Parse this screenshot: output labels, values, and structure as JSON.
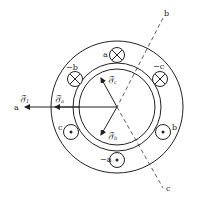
{
  "diagram": {
    "axes": {
      "a": "a",
      "b": "b",
      "c": "c"
    },
    "conductors": [
      {
        "label": "a",
        "type": "cross"
      },
      {
        "label": "−b",
        "type": "cross"
      },
      {
        "label": "−c",
        "type": "cross"
      },
      {
        "label": "c",
        "type": "dot"
      },
      {
        "label": "b",
        "type": "dot"
      },
      {
        "label": "−a",
        "type": "dot"
      }
    ],
    "vectors": {
      "total": "𝔉",
      "total_sub": "1",
      "fa": "𝔉",
      "fa_sub": "a",
      "fb": "𝔉",
      "fb_sub": "b",
      "fc": "𝔉",
      "fc_sub": "c"
    }
  }
}
